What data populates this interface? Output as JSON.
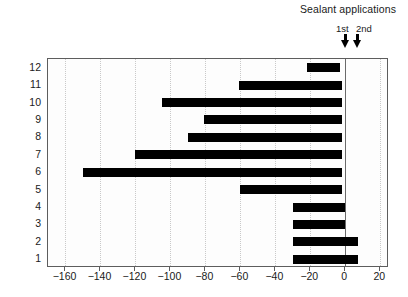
{
  "annotation": {
    "title": "Sealant applications",
    "markers": [
      {
        "label": "1st",
        "x_value": -2.5
      },
      {
        "label": "2nd",
        "x_value": 8.0
      }
    ]
  },
  "axes": {
    "ylabel": "No. of cases",
    "xlabel": "",
    "xticks": [
      "−160",
      "−140",
      "−120",
      "−100",
      "−80",
      "−60",
      "−40",
      "−20",
      "0",
      "20"
    ],
    "yticks": [
      "12",
      "11",
      "10",
      "9",
      "8",
      "7",
      "6",
      "5",
      "4",
      "3",
      "2",
      "1"
    ]
  },
  "colors": {
    "bar": "#000000",
    "frame": "#5d5d5d",
    "grid": "#c9c9c9",
    "zero": "#6a6a6a",
    "background": "#ffffff"
  },
  "chart_data": {
    "type": "bar",
    "orientation": "horizontal",
    "title": "",
    "xlabel": "",
    "ylabel": "No. of cases",
    "xlim": [
      -170,
      25
    ],
    "xticks": [
      -160,
      -140,
      -120,
      -100,
      -80,
      -60,
      -40,
      -20,
      0,
      20
    ],
    "grid": true,
    "legend": false,
    "note": "Floating horizontal bars (ranges). Each case shows the interval spanned relative to the sealant applications reference at 0.",
    "categories": [
      "1",
      "2",
      "3",
      "4",
      "5",
      "6",
      "7",
      "8",
      "9",
      "10",
      "11",
      "12"
    ],
    "bars": [
      {
        "case": "12",
        "start": -22,
        "end": -3,
        "length": 19
      },
      {
        "case": "11",
        "start": -61,
        "end": -2,
        "length": 59
      },
      {
        "case": "10",
        "start": -105,
        "end": -2,
        "length": 103
      },
      {
        "case": "9",
        "start": -81,
        "end": -2,
        "length": 79
      },
      {
        "case": "8",
        "start": -90,
        "end": -2,
        "length": 88
      },
      {
        "case": "7",
        "start": -120,
        "end": -2,
        "length": 118
      },
      {
        "case": "6",
        "start": -150,
        "end": -2,
        "length": 148
      },
      {
        "case": "5",
        "start": -60,
        "end": -2,
        "length": 58
      },
      {
        "case": "4",
        "start": -30,
        "end": 0,
        "length": 30
      },
      {
        "case": "3",
        "start": -30,
        "end": 0,
        "length": 30
      },
      {
        "case": "2",
        "start": -30,
        "end": 7,
        "length": 37
      },
      {
        "case": "1",
        "start": -30,
        "end": 7,
        "length": 37
      }
    ],
    "annotations": [
      {
        "text": "Sealant applications",
        "type": "title"
      },
      {
        "text": "1st",
        "type": "arrow-marker",
        "x": -2.5
      },
      {
        "text": "2nd",
        "type": "arrow-marker",
        "x": 8.0
      }
    ]
  }
}
